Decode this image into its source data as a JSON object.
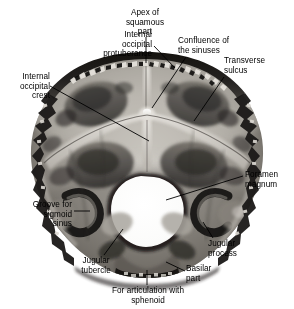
{
  "figure": {
    "image_kind": "grayscale anatomical photograph",
    "background_color": "#ffffff",
    "label_color": "#000000",
    "leader_color": "#000000",
    "bone_tone_light": "#d8d6d1",
    "bone_tone_mid": "#8e8b85",
    "bone_tone_dark": "#2a2826",
    "foramen_color": "#ffffff"
  },
  "labels": [
    {
      "id": "apex-of-squamous-part",
      "text": "Apex of\nsquamous\npart",
      "align": "center",
      "x": 114,
      "y": 8,
      "w": 62
    },
    {
      "id": "internal-occipital-protuberance",
      "text": "Internal\noccipital\nprotuberance",
      "align": "right",
      "x": 56,
      "y": 30,
      "w": 96
    },
    {
      "id": "confluence-of-the-sinuses",
      "text": "Confluence of\nthe sinuses",
      "align": "left",
      "x": 178,
      "y": 36,
      "w": 82
    },
    {
      "id": "transverse-sulcus",
      "text": "Transverse\nsulcus",
      "align": "left",
      "x": 224,
      "y": 56,
      "w": 66
    },
    {
      "id": "internal-occipital-crest",
      "text": "Internal\noccipital\ncrest",
      "align": "right",
      "x": 2,
      "y": 72,
      "w": 48
    },
    {
      "id": "foramen-magnum",
      "text": "Foramen\nmagnum",
      "align": "left",
      "x": 245,
      "y": 170,
      "w": 50
    },
    {
      "id": "groove-for-sigmoid-sinus",
      "text": "Groove for\nsigmoid\nsinus",
      "align": "right",
      "x": 8,
      "y": 200,
      "w": 64
    },
    {
      "id": "jugular-process",
      "text": "Jugular\nprocess",
      "align": "left",
      "x": 208,
      "y": 239,
      "w": 52
    },
    {
      "id": "jugular-tubercle",
      "text": "Jugular\ntubercle",
      "align": "center",
      "x": 70,
      "y": 256,
      "w": 52
    },
    {
      "id": "basilar-part",
      "text": "Basilar\npart",
      "align": "left",
      "x": 186,
      "y": 264,
      "w": 40
    },
    {
      "id": "for-articulation-with-sphenoid",
      "text": "For articulation with\nsphenoid",
      "align": "center",
      "x": 90,
      "y": 286,
      "w": 116
    }
  ],
  "leaders": [
    {
      "id": "leader-apex-of-squamous-part",
      "points": "146,37 146,63"
    },
    {
      "id": "leader-internal-occipital-protuberance",
      "points": "154,46 175,68"
    },
    {
      "id": "leader-confluence-of-the-sinuses",
      "points": "186,57 152,108"
    },
    {
      "id": "leader-transverse-sulcus",
      "points": "224,77 194,121"
    },
    {
      "id": "leader-internal-occipital-crest",
      "points": "50,86 149,141"
    },
    {
      "id": "leader-foramen-magnum",
      "points": "243,176 166,200"
    },
    {
      "id": "leader-groove-for-sigmoid-sinus",
      "points": "74,211 90,211"
    },
    {
      "id": "leader-jugular-process",
      "points": "213,238 203,222"
    },
    {
      "id": "leader-jugular-tubercle",
      "points": "104,255 123,229"
    },
    {
      "id": "leader-basilar-part",
      "points": "185,271 166,262"
    },
    {
      "id": "leader-for-articulation-with-sphenoid",
      "points": "147,285 147,270"
    }
  ]
}
